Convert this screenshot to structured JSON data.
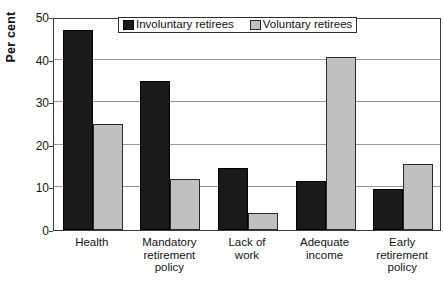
{
  "chart_data": {
    "type": "bar",
    "title": "",
    "xlabel": "",
    "ylabel": "Per cent",
    "ylim": [
      0,
      50
    ],
    "yticks": [
      0,
      10,
      20,
      30,
      40,
      50
    ],
    "grid": "horizontal",
    "legend_position": "top-center",
    "categories": [
      "Health",
      "Mandatory retirement policy",
      "Lack of work",
      "Adequate income",
      "Early retirement policy"
    ],
    "category_lines": [
      [
        "Health"
      ],
      [
        "Mandatory",
        "retirement",
        "policy"
      ],
      [
        "Lack of",
        "work"
      ],
      [
        "Adequate",
        "income"
      ],
      [
        "Early",
        "retirement",
        "policy"
      ]
    ],
    "series": [
      {
        "name": "Involuntary retirees",
        "color": "#1a1a1a",
        "values": [
          47,
          35,
          14.5,
          11.5,
          9.7
        ]
      },
      {
        "name": "Voluntary retirees",
        "color": "#c0c0c0",
        "values": [
          25,
          12,
          4,
          40.5,
          15.5
        ]
      }
    ]
  },
  "axis": {
    "y_title": "Per cent",
    "y_tick_labels": [
      "50",
      "40",
      "30",
      "20",
      "10",
      "0"
    ]
  },
  "legend": {
    "entries": [
      {
        "label": "Involuntary retirees",
        "swatch": "dark-swatch-icon"
      },
      {
        "label": "Voluntary retirees",
        "swatch": "light-swatch-icon"
      }
    ]
  },
  "colors": {
    "involuntary": "#1a1a1a",
    "voluntary": "#c0c0c0",
    "axis": "#3a3a3a",
    "gridline": "#9a9a9a",
    "background": "#ffffff"
  }
}
